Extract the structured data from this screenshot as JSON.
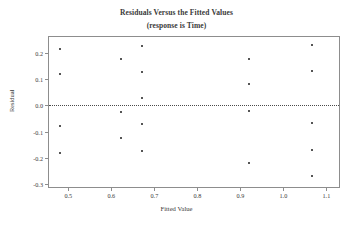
{
  "chart_data": {
    "type": "scatter",
    "title": "Residuals Versus the Fitted Values",
    "subtitle": "(response is Time)",
    "xlabel": "Fitted Value",
    "ylabel": "Residual",
    "xlim": [
      0.455,
      1.134
    ],
    "ylim": [
      -0.318,
      0.26
    ],
    "xticks": [
      0.5,
      0.6,
      0.7,
      0.8,
      0.9,
      1.0,
      1.1
    ],
    "xticklabels": [
      "0.5",
      "0.6",
      "0.7",
      "0.8",
      "0.9",
      "1.0",
      "1.1"
    ],
    "yticks": [
      0.2,
      0.1,
      0.0,
      -0.1,
      -0.2,
      -0.3
    ],
    "yticklabels": [
      "0.2",
      "0.1",
      "0.0",
      "-0.1",
      "-0.2",
      "-0.3"
    ],
    "grid": false,
    "legend": null,
    "reference_line": {
      "y": 0.0,
      "style": "dotted"
    },
    "marker": {
      "shape": "square",
      "color": "#555555",
      "size": 2
    },
    "points": [
      {
        "x": 0.48,
        "y": 0.215
      },
      {
        "x": 0.48,
        "y": 0.12
      },
      {
        "x": 0.48,
        "y": -0.08
      },
      {
        "x": 0.48,
        "y": -0.18
      },
      {
        "x": 0.622,
        "y": 0.175
      },
      {
        "x": 0.622,
        "y": -0.025
      },
      {
        "x": 0.622,
        "y": -0.125
      },
      {
        "x": 0.672,
        "y": 0.225
      },
      {
        "x": 0.672,
        "y": 0.128
      },
      {
        "x": 0.672,
        "y": 0.028
      },
      {
        "x": 0.672,
        "y": -0.072
      },
      {
        "x": 0.672,
        "y": -0.172
      },
      {
        "x": 0.92,
        "y": 0.178
      },
      {
        "x": 0.92,
        "y": 0.08
      },
      {
        "x": 0.92,
        "y": -0.02
      },
      {
        "x": 0.92,
        "y": -0.22
      },
      {
        "x": 1.066,
        "y": 0.23
      },
      {
        "x": 1.066,
        "y": 0.132
      },
      {
        "x": 1.066,
        "y": -0.068
      },
      {
        "x": 1.066,
        "y": -0.168
      },
      {
        "x": 1.066,
        "y": -0.268
      }
    ]
  }
}
